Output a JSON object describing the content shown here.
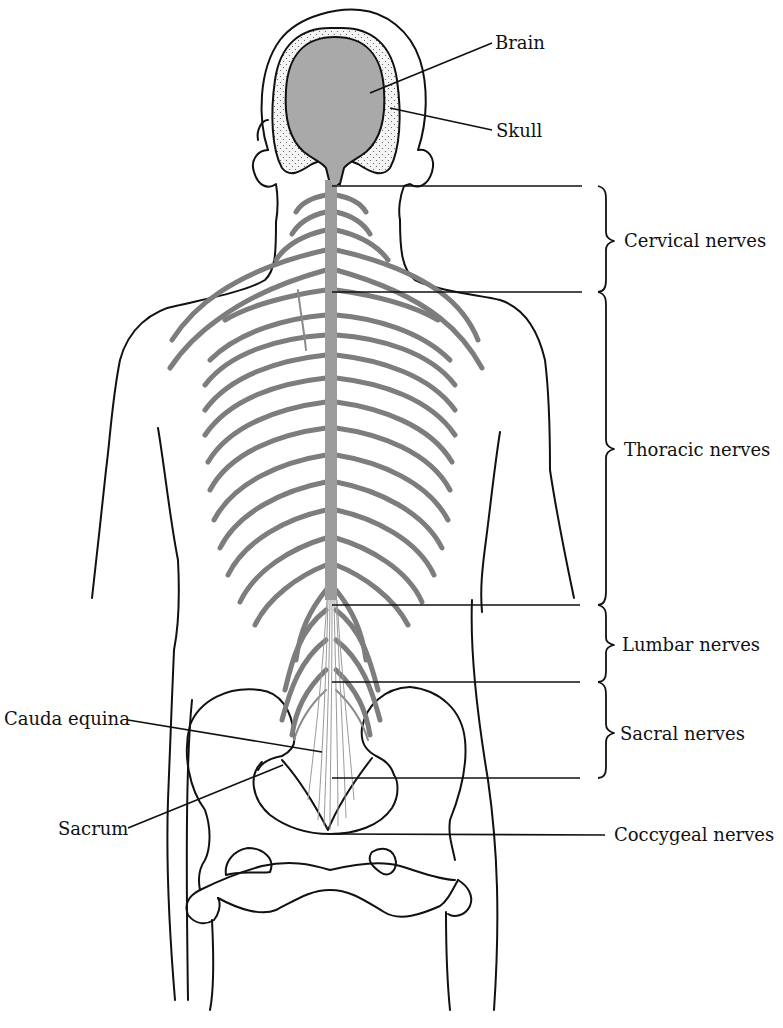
{
  "diagram": {
    "colors": {
      "outline": "#111111",
      "nerve": "#7d7d7d",
      "brain": "#a9a9a9",
      "background": "#ffffff"
    },
    "labels": {
      "brain": "Brain",
      "skull": "Skull",
      "cervical": "Cervical nerves",
      "thoracic": "Thoracic nerves",
      "lumbar": "Lumbar nerves",
      "sacral": "Sacral nerves",
      "coccygeal": "Coccygeal nerves",
      "cauda_equina": "Cauda equina",
      "sacrum": "Sacrum"
    },
    "regions": [
      {
        "name": "Cervical nerves",
        "y_top": 186,
        "y_bottom": 292
      },
      {
        "name": "Thoracic nerves",
        "y_top": 292,
        "y_bottom": 605
      },
      {
        "name": "Lumbar nerves",
        "y_top": 605,
        "y_bottom": 682
      },
      {
        "name": "Sacral nerves",
        "y_top": 682,
        "y_bottom": 778
      }
    ]
  }
}
